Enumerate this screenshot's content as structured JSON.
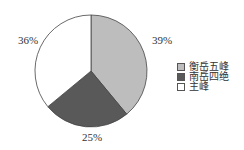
{
  "chart_data": {
    "type": "pie",
    "title": "",
    "categories": [
      "衡岳五峰",
      "南岳四绝",
      "主峰"
    ],
    "values": [
      39,
      25,
      36
    ],
    "labels": [
      "39%",
      "25%",
      "36%"
    ],
    "colors": [
      "#bdbdbd",
      "#595959",
      "#ffffff"
    ],
    "legend_position": "right",
    "start_angle_deg": 90,
    "direction": "clockwise"
  },
  "legend": {
    "items": [
      {
        "label": "衡岳五峰",
        "color": "#bdbdbd"
      },
      {
        "label": "南岳四绝",
        "color": "#595959"
      },
      {
        "label": "主峰",
        "color": "#ffffff"
      }
    ]
  },
  "slice_labels": {
    "s0": "39%",
    "s1": "25%",
    "s2": "36%"
  }
}
